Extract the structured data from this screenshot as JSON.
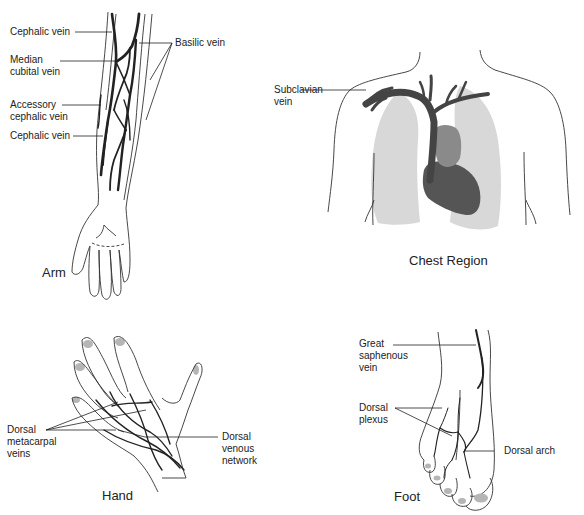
{
  "figure": {
    "panels": [
      {
        "id": "arm",
        "caption": "Arm",
        "labels": [
          {
            "text": "Cephalic vein"
          },
          {
            "text": "Median\ncubital vein"
          },
          {
            "text": "Accessory\ncephalic vein"
          },
          {
            "text": "Cephalic vein"
          },
          {
            "text": "Basilic vein"
          }
        ]
      },
      {
        "id": "chest",
        "caption": "Chest Region",
        "labels": [
          {
            "text": "Subclavian\nvein"
          }
        ]
      },
      {
        "id": "hand",
        "caption": "Hand",
        "labels": [
          {
            "text": "Dorsal\nmetacarpal\nveins"
          },
          {
            "text": "Dorsal\nvenous\nnetwork"
          }
        ]
      },
      {
        "id": "foot",
        "caption": "Foot",
        "labels": [
          {
            "text": "Great\nsaphenous\nvein"
          },
          {
            "text": "Dorsal\nplexus"
          },
          {
            "text": "Dorsal arch"
          }
        ]
      }
    ],
    "colors": {
      "vein": "#2a2a2a",
      "outline": "#333333",
      "lung": "#d8d8d8",
      "heart_dark": "#555555",
      "heart_light": "#8a8a8a",
      "nail": "#b5b5b5"
    }
  }
}
